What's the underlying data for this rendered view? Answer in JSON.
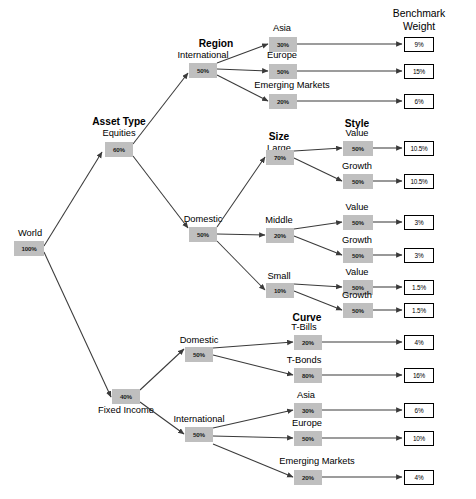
{
  "diagram": {
    "column_header": {
      "line1": "Benchmark",
      "line2": "Weight"
    },
    "section_headers": [
      {
        "name": "region",
        "label": "Region"
      },
      {
        "name": "asset-type",
        "label": "Asset Type"
      },
      {
        "name": "size",
        "label": "Size"
      },
      {
        "name": "style",
        "label": "Style"
      },
      {
        "name": "curve",
        "label": "Curve"
      }
    ],
    "nodes": [
      {
        "id": "world",
        "label": "World",
        "value": "100%"
      },
      {
        "id": "equities",
        "label": "Equities",
        "value": "60%"
      },
      {
        "id": "fixed-income",
        "label": "Fixed Income",
        "value": "40%"
      },
      {
        "id": "eq-intl",
        "label": "International",
        "value": "50%"
      },
      {
        "id": "eq-dom",
        "label": "Domestic",
        "value": "50%"
      },
      {
        "id": "eq-intl-asia",
        "label": "Asia",
        "value": "30%"
      },
      {
        "id": "eq-intl-eur",
        "label": "Europe",
        "value": "50%"
      },
      {
        "id": "eq-intl-em",
        "label": "Emerging Markets",
        "value": "20%"
      },
      {
        "id": "eq-large",
        "label": "Large",
        "value": "70%"
      },
      {
        "id": "eq-middle",
        "label": "Middle",
        "value": "20%"
      },
      {
        "id": "eq-small",
        "label": "Small",
        "value": "10%"
      },
      {
        "id": "large-value",
        "label": "Value",
        "value": "50%"
      },
      {
        "id": "large-growth",
        "label": "Growth",
        "value": "50%"
      },
      {
        "id": "mid-value",
        "label": "Value",
        "value": "50%"
      },
      {
        "id": "mid-growth",
        "label": "Growth",
        "value": "50%"
      },
      {
        "id": "small-value",
        "label": "Value",
        "value": "50%"
      },
      {
        "id": "small-growth",
        "label": "Growth",
        "value": "50%"
      },
      {
        "id": "fi-dom",
        "label": "Domestic",
        "value": "50%"
      },
      {
        "id": "fi-intl",
        "label": "International",
        "value": "50%"
      },
      {
        "id": "fi-tbills",
        "label": "T-Bills",
        "value": "20%"
      },
      {
        "id": "fi-tbonds",
        "label": "T-Bonds",
        "value": "80%"
      },
      {
        "id": "fi-asia",
        "label": "Asia",
        "value": "30%"
      },
      {
        "id": "fi-eur",
        "label": "Europe",
        "value": "50%"
      },
      {
        "id": "fi-em",
        "label": "Emerging Markets",
        "value": "20%"
      }
    ],
    "benchmark_weights": [
      {
        "id": "bm-eq-intl-asia",
        "value": "9%"
      },
      {
        "id": "bm-eq-intl-eur",
        "value": "15%"
      },
      {
        "id": "bm-eq-intl-em",
        "value": "6%"
      },
      {
        "id": "bm-large-value",
        "value": "10.5%"
      },
      {
        "id": "bm-large-growth",
        "value": "10.5%"
      },
      {
        "id": "bm-mid-value",
        "value": "3%"
      },
      {
        "id": "bm-mid-growth",
        "value": "3%"
      },
      {
        "id": "bm-small-value",
        "value": "1.5%"
      },
      {
        "id": "bm-small-growth",
        "value": "1.5%"
      },
      {
        "id": "bm-fi-tbills",
        "value": "4%"
      },
      {
        "id": "bm-fi-tbonds",
        "value": "16%"
      },
      {
        "id": "bm-fi-asia",
        "value": "6%"
      },
      {
        "id": "bm-fi-eur",
        "value": "10%"
      },
      {
        "id": "bm-fi-em",
        "value": "4%"
      }
    ],
    "colors": {
      "node_fill": "#bfbfbf",
      "edge": "#3a3a3a",
      "box_border": "#000000"
    }
  }
}
